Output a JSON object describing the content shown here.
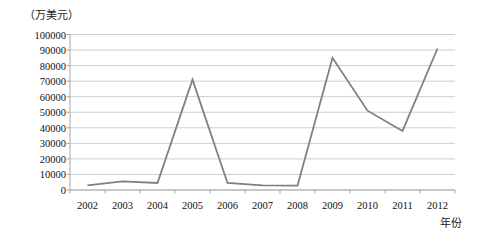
{
  "chart_data": {
    "type": "line",
    "title": "",
    "subtitle": "",
    "ylabel": "（万美元）",
    "xlabel": "年份",
    "categories": [
      "2002",
      "2003",
      "2004",
      "2005",
      "2006",
      "2007",
      "2008",
      "2009",
      "2010",
      "2011",
      "2012"
    ],
    "values": [
      3000,
      5500,
      4500,
      71000,
      4500,
      3000,
      2800,
      85000,
      51000,
      38000,
      91000
    ],
    "series": [
      {
        "name": "",
        "values": [
          3000,
          5500,
          4500,
          71000,
          4500,
          3000,
          2800,
          85000,
          51000,
          38000,
          91000
        ]
      }
    ],
    "ylim": [
      0,
      100000
    ],
    "ytick_step": 10000,
    "yticks": [
      0,
      10000,
      20000,
      30000,
      40000,
      50000,
      60000,
      70000,
      80000,
      90000,
      100000
    ],
    "ytick_labels": [
      "0",
      "10000",
      "20000",
      "30000",
      "40000",
      "50000",
      "60000",
      "70000",
      "80000",
      "90000",
      "100000"
    ],
    "grid": "horizontal",
    "legend": "none",
    "line_color": "#808080",
    "gridline_color": "#c8c8c8",
    "axis_color": "#a6a6a6",
    "markers": "none",
    "annotations": []
  }
}
